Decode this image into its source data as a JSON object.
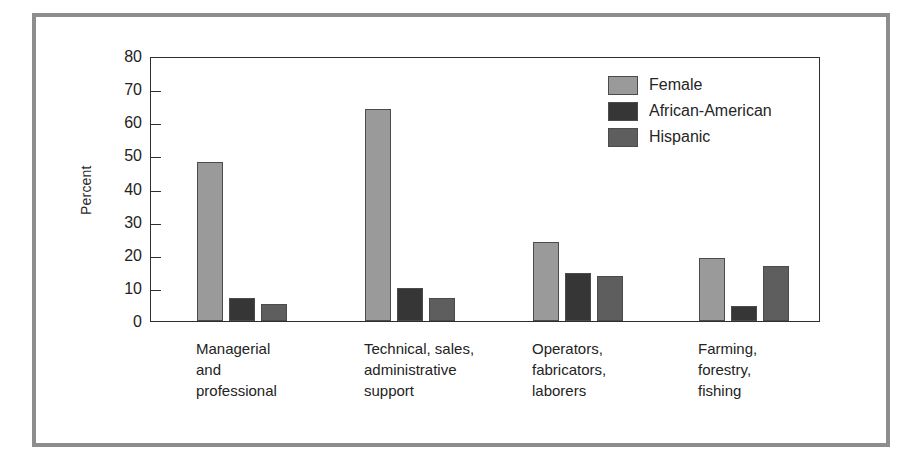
{
  "chart_data": {
    "type": "bar",
    "title": "",
    "subtitle": "",
    "xlabel": "",
    "ylabel": "Percent",
    "ylim": [
      0,
      80
    ],
    "yticks": [
      0,
      10,
      20,
      30,
      40,
      50,
      60,
      70,
      80
    ],
    "ytick_labels": [
      "0",
      "10",
      "20",
      "30",
      "40",
      "50",
      "60",
      "70",
      "80"
    ],
    "grid": false,
    "legend_position": "top-right",
    "categories": [
      "Managerial and professional",
      "Technical, sales, administrative support",
      "Operators, fabricators, laborers",
      "Farming, forestry, fishing"
    ],
    "category_lines": [
      [
        "Managerial",
        "and",
        "professional"
      ],
      [
        "Technical, sales,",
        "administrative",
        "support"
      ],
      [
        "Operators,",
        "fabricators,",
        "laborers"
      ],
      [
        "Farming,",
        "forestry,",
        "fishing"
      ]
    ],
    "series": [
      {
        "name": "Female",
        "color": "#9a9a9a",
        "values": [
          48,
          64,
          24,
          19
        ]
      },
      {
        "name": "African-American",
        "color": "#363636",
        "values": [
          7,
          10,
          14.5,
          4.5
        ]
      },
      {
        "name": "Hispanic",
        "color": "#5e5e5e",
        "values": [
          5,
          7,
          13.5,
          16.5
        ]
      }
    ]
  },
  "colors": {
    "frame": "#8d8d8d",
    "axis": "#2e2e2e",
    "text": "#232323",
    "background": "#ffffff"
  }
}
